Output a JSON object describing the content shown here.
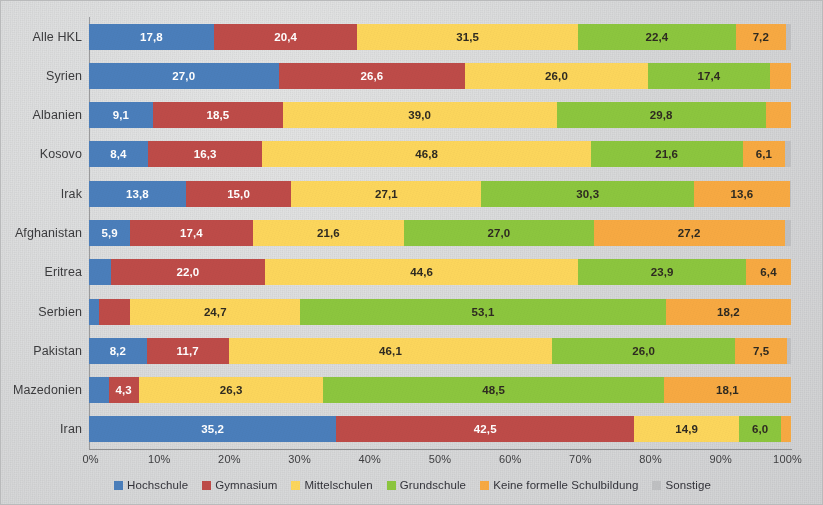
{
  "chart_data": {
    "type": "bar",
    "orientation": "horizontal",
    "stacked": true,
    "stack_mode": "percent",
    "title": "",
    "subtitle": "",
    "xlabel": "",
    "ylabel": "",
    "xlim": [
      0,
      100
    ],
    "grid": false,
    "legend_position": "bottom",
    "xtick_labels": [
      "0%",
      "10%",
      "20%",
      "30%",
      "40%",
      "50%",
      "60%",
      "70%",
      "80%",
      "90%",
      "100%"
    ],
    "xtick_values": [
      0,
      10,
      20,
      30,
      40,
      50,
      60,
      70,
      80,
      90,
      100
    ],
    "categories": [
      "Alle HKL",
      "Syrien",
      "Albanien",
      "Kosovo",
      "Irak",
      "Afghanistan",
      "Eritrea",
      "Serbien",
      "Pakistan",
      "Mazedonien",
      "Iran"
    ],
    "series": [
      {
        "name": "Hochschule",
        "color": "#4a7ebb",
        "values": [
          17.8,
          27.0,
          9.1,
          8.4,
          13.8,
          5.9,
          3.1,
          1.5,
          8.2,
          2.8,
          35.2
        ]
      },
      {
        "name": "Gymnasium",
        "color": "#be4b48",
        "values": [
          20.4,
          26.6,
          18.5,
          16.3,
          15.0,
          17.4,
          22.0,
          4.5,
          11.7,
          4.3,
          42.5
        ]
      },
      {
        "name": "Mittelschulen",
        "color": "#fcd65c",
        "values": [
          31.5,
          26.0,
          39.0,
          46.8,
          27.1,
          21.6,
          44.6,
          24.7,
          46.1,
          26.3,
          14.9
        ]
      },
      {
        "name": "Grundschule",
        "color": "#8cc63e",
        "values": [
          22.4,
          17.4,
          29.8,
          21.6,
          30.3,
          27.0,
          23.9,
          53.1,
          26.0,
          48.5,
          6.0
        ]
      },
      {
        "name": "Keine formelle Schulbildung",
        "color": "#f7a942",
        "values": [
          7.2,
          3.0,
          3.6,
          6.1,
          13.6,
          27.2,
          6.4,
          18.2,
          7.5,
          18.1,
          1.4
        ]
      },
      {
        "name": "Sonstige",
        "color": "#bfc0c2",
        "values": [
          0.7,
          0.0,
          0.0,
          0.8,
          0.2,
          0.9,
          0.0,
          0.0,
          0.5,
          0.0,
          0.0
        ]
      }
    ],
    "labeled_values": {
      "Alle HKL": [
        "17,8",
        "20,4",
        "31,5",
        "22,4",
        "7,2",
        ""
      ],
      "Syrien": [
        "27,0",
        "26,6",
        "26,0",
        "17,4",
        "",
        ""
      ],
      "Albanien": [
        "9,1",
        "18,5",
        "39,0",
        "29,8",
        "",
        ""
      ],
      "Kosovo": [
        "8,4",
        "16,3",
        "46,8",
        "21,6",
        "6,1",
        ""
      ],
      "Irak": [
        "13,8",
        "15,0",
        "27,1",
        "30,3",
        "13,6",
        ""
      ],
      "Afghanistan": [
        "5,9",
        "17,4",
        "21,6",
        "27,0",
        "27,2",
        ""
      ],
      "Eritrea": [
        "",
        "22,0",
        "44,6",
        "23,9",
        "6,4",
        ""
      ],
      "Serbien": [
        "",
        "",
        "24,7",
        "53,1",
        "18,2",
        ""
      ],
      "Pakistan": [
        "8,2",
        "11,7",
        "46,1",
        "26,0",
        "7,5",
        ""
      ],
      "Mazedonien": [
        "",
        "4,3",
        "26,3",
        "48,5",
        "18,1",
        ""
      ],
      "Iran": [
        "35,2",
        "42,5",
        "14,9",
        "6,0",
        "",
        ""
      ]
    }
  },
  "legend": {
    "items": [
      {
        "label": "Hochschule",
        "color": "#4a7ebb"
      },
      {
        "label": "Gymnasium",
        "color": "#be4b48"
      },
      {
        "label": "Mittelschulen",
        "color": "#fcd65c"
      },
      {
        "label": "Grundschule",
        "color": "#8cc63e"
      },
      {
        "label": "Keine formelle Schulbildung",
        "color": "#f7a942"
      },
      {
        "label": "Sonstige",
        "color": "#bfc0c2"
      }
    ]
  }
}
